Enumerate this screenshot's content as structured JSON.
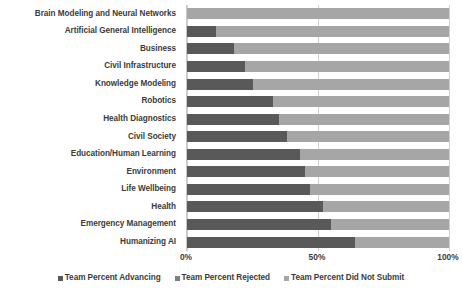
{
  "chart_data": {
    "type": "bar",
    "subtype": "stacked-horizontal-100",
    "title": "",
    "xlabel": "",
    "ylabel": "",
    "xlim": [
      0,
      100
    ],
    "grid": true,
    "legend_position": "bottom",
    "tick_labels": [
      "0%",
      "50%",
      "100%"
    ],
    "tick_values": [
      0,
      50,
      100
    ],
    "categories": [
      "Brain Modeling and Neural Networks",
      "Artificial General Intelligence",
      "Business",
      "Civil Infrastructure",
      "Knowledge Modeling",
      "Robotics",
      "Health Diagnostics",
      "Civil Society",
      "Education/Human Learning",
      "Environment",
      "Life Wellbeing",
      "Health",
      "Emergency Management",
      "Humanizing AI"
    ],
    "series": [
      {
        "name": "Team Percent Advancing",
        "color": "#595959",
        "values": [
          0,
          11,
          18,
          22,
          25,
          33,
          35,
          38,
          43,
          45,
          47,
          52,
          55,
          64
        ]
      },
      {
        "name": "Team Percent Rejected",
        "color": "#7f7f7f",
        "values": [
          0,
          0,
          0,
          0,
          0,
          0,
          0,
          0,
          0,
          0,
          0,
          0,
          0,
          0
        ]
      },
      {
        "name": "Team Percent Did Not Submit",
        "color": "#a6a6a6",
        "values": [
          100,
          89,
          82,
          78,
          75,
          67,
          65,
          62,
          57,
          55,
          53,
          48,
          45,
          36
        ]
      }
    ]
  },
  "legend": {
    "items": [
      {
        "label": "Team Percent Advancing",
        "color": "#595959"
      },
      {
        "label": "Team Percent Rejected",
        "color": "#7f7f7f"
      },
      {
        "label": "Team Percent Did Not Submit",
        "color": "#a6a6a6"
      }
    ]
  }
}
